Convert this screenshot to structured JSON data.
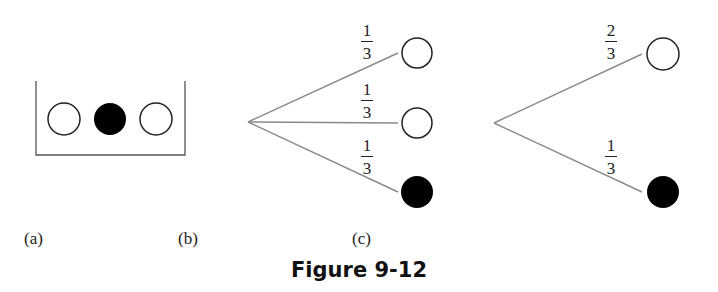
{
  "figure": {
    "caption": "Figure 9-12",
    "colors": {
      "line": "#8a8a8a",
      "outline": "#222222",
      "filled": "#000000",
      "background": "#ffffff"
    }
  },
  "panel_a": {
    "label": "(a)",
    "description": "Urn containing three balls",
    "balls": [
      "white",
      "black",
      "white"
    ]
  },
  "panel_b": {
    "label": "(b)",
    "description": "Probability tree with three branches",
    "branches": [
      {
        "probability_num": "1",
        "probability_den": "3",
        "outcome": "white"
      },
      {
        "probability_num": "1",
        "probability_den": "3",
        "outcome": "white"
      },
      {
        "probability_num": "1",
        "probability_den": "3",
        "outcome": "black"
      }
    ]
  },
  "panel_c": {
    "label": "(c)",
    "description": "Probability tree with two branches",
    "branches": [
      {
        "probability_num": "2",
        "probability_den": "3",
        "outcome": "white"
      },
      {
        "probability_num": "1",
        "probability_den": "3",
        "outcome": "black"
      }
    ]
  }
}
